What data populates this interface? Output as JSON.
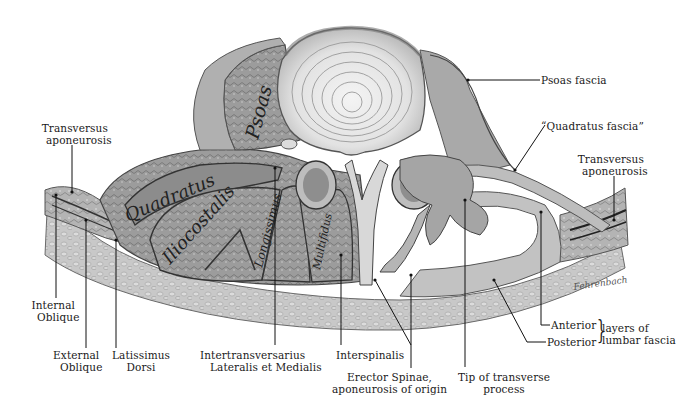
{
  "figure": {
    "colors": {
      "background": "#ffffff",
      "ink": "#1a1a1a",
      "tissue_light": "#d9d9d9",
      "tissue_mid": "#a8a8a8",
      "tissue_dark": "#6e6e6e"
    },
    "signature": "Fehrenbach"
  },
  "muscle_labels": {
    "psoas": "Psoas",
    "quadratus": "Quadratus",
    "iliocostalis": "Iliocostalis",
    "longissimus": "Longissimus",
    "multifidus": "Multifidus"
  },
  "labels": {
    "transversus_left": {
      "line1": "Transversus",
      "line2": "aponeurosis"
    },
    "psoas_fascia": "Psoas fascia",
    "quadratus_fascia": "“Quadratus fascia”",
    "transversus_right": {
      "line1": "Transversus",
      "line2": "aponeurosis"
    },
    "internal_oblique": {
      "line1": "Internal",
      "line2": "Oblique"
    },
    "external_oblique": {
      "line1": "External",
      "line2": "Oblique"
    },
    "latissimus_dorsi": {
      "line1": "Latissimus",
      "line2": "Dorsi"
    },
    "intertransversarius": {
      "line1": "Intertransversarius",
      "line2": "Lateralis et Medialis"
    },
    "interspinalis": "Interspinalis",
    "erector_spinae": {
      "line1": "Erector Spinae,",
      "line2": "aponeurosis of origin"
    },
    "tip_transverse": {
      "line1": "Tip of transverse",
      "line2": "process"
    },
    "anterior": "Anterior",
    "posterior": "Posterior",
    "lumbar_fascia": {
      "line1": "layers of",
      "line2": "lumbar fascia"
    }
  }
}
